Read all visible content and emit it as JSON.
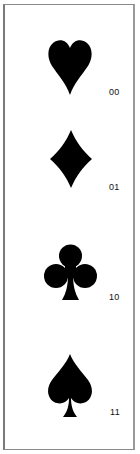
{
  "figure": {
    "type": "suit-encoding-table",
    "entries": [
      {
        "suit": "hearts",
        "icon": "heart-icon",
        "code": "00"
      },
      {
        "suit": "diamonds",
        "icon": "diamond-icon",
        "code": "01"
      },
      {
        "suit": "clubs",
        "icon": "club-icon",
        "code": "10"
      },
      {
        "suit": "spades",
        "icon": "spade-icon",
        "code": "11"
      }
    ],
    "colors": {
      "symbol": "#000000",
      "border": "#8a8a8a",
      "background": "#ffffff",
      "text": "#111111"
    }
  }
}
